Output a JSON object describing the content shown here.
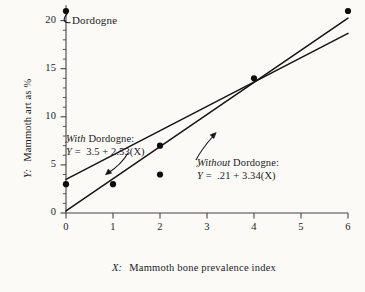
{
  "chart_data": {
    "type": "scatter",
    "title": "",
    "xlabel": "X:  Mammoth bone prevalence index",
    "ylabel": "Y:  Mammoth art as %",
    "xlim": [
      0,
      6
    ],
    "ylim": [
      0,
      21.6
    ],
    "grid": false,
    "legend": "none",
    "x_ticks": [
      0,
      1,
      2,
      3,
      4,
      5,
      6
    ],
    "x_tick_labels": [
      "0",
      "1",
      "2",
      "3",
      "4",
      "5",
      "6"
    ],
    "y_ticks": [
      0,
      5,
      10,
      15,
      20
    ],
    "y_tick_labels": [
      "0",
      "5",
      "10",
      "15",
      "20"
    ],
    "y_minor_ticks": [
      1,
      2,
      3,
      4,
      6,
      7,
      8,
      9,
      11,
      12,
      13,
      14,
      16,
      17,
      18,
      19,
      21
    ],
    "points": [
      {
        "x": 0,
        "y": 21,
        "label": "Dordogne"
      },
      {
        "x": 0,
        "y": 3,
        "label": ""
      },
      {
        "x": 1,
        "y": 3,
        "label": ""
      },
      {
        "x": 2,
        "y": 7,
        "label": ""
      },
      {
        "x": 2,
        "y": 4,
        "label": ""
      },
      {
        "x": 4,
        "y": 14,
        "label": ""
      },
      {
        "x": 6,
        "y": 21,
        "label": ""
      }
    ],
    "series": [
      {
        "name": "With Dordogne",
        "type": "line",
        "intercept": 3.5,
        "slope": 2.53,
        "equation": "Y = 3.5 + 2.53(X)",
        "x_range": [
          0,
          6
        ]
      },
      {
        "name": "Without Dordogne",
        "type": "line",
        "intercept": 0.21,
        "slope": 3.34,
        "equation": "Y = .21 + 3.34(X)",
        "x_range": [
          0,
          6
        ]
      }
    ],
    "annotations": [
      {
        "name": "dordogne",
        "text": "Dordogne",
        "points_to": {
          "x": 0,
          "y": 21
        }
      },
      {
        "name": "with-dordogne",
        "line1_em": "With",
        "line1_rest": " Dordogne:",
        "line2_prefix": "Y",
        "line2_rest": " =  3.5 + 2.53(X)",
        "points_to_series": "With Dordogne"
      },
      {
        "name": "without-dordogne",
        "line1_em": "Without",
        "line1_rest": " Dordogne:",
        "line2_prefix": "Y",
        "line2_rest": " =  .21 + 3.34(X)",
        "points_to_series": "Without Dordogne"
      }
    ],
    "colors": {
      "background": "#fbfaf7",
      "ink": "#1b1b1f",
      "axis": "#44444a",
      "marker": "#0d0d10",
      "line": "#141418"
    }
  },
  "axis_titles": {
    "x_var": "X:",
    "x_text": "Mammoth bone prevalence index",
    "y_var": "Y:",
    "y_text": "Mammoth art as %"
  }
}
